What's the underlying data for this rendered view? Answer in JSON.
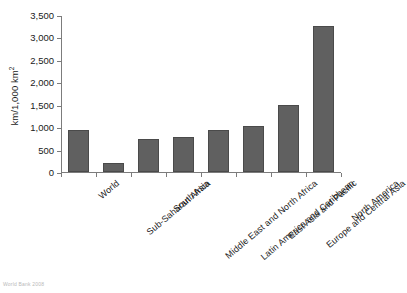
{
  "chart_data": {
    "type": "bar",
    "title": "",
    "subtitle": "",
    "xlabel": "",
    "ylabel": "km/1,000 km",
    "ylabel_superscript": "2",
    "ylim": [
      0,
      3500
    ],
    "ytick_step": 500,
    "grid": false,
    "legend": null,
    "bar_color": "#606060",
    "axis_color": "#7c7c7c",
    "categories": [
      "World",
      "Sub-Saharan Africa",
      "South Asia",
      "Middle East and North Africa",
      "Latin America and Caribbean",
      "East Asia and Pacific",
      "Europe and Central Asia",
      "North America"
    ],
    "values": [
      930,
      210,
      740,
      770,
      930,
      1030,
      1500,
      3250
    ],
    "ytick_labels": [
      "0",
      "500",
      "1,000",
      "1,500",
      "2,000",
      "2,500",
      "3,000",
      "3,500"
    ],
    "ytick_values": [
      0,
      500,
      1000,
      1500,
      2000,
      2500,
      3000,
      3500
    ]
  },
  "footer": {
    "source_note": "World Bank 2008"
  }
}
